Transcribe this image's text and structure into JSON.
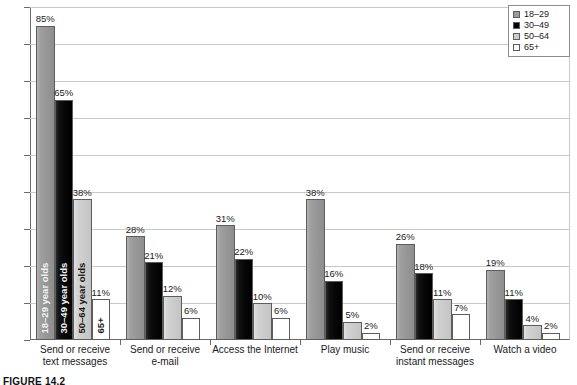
{
  "chart_data": {
    "type": "bar",
    "title": "",
    "xlabel": "",
    "ylabel": "",
    "ylim": [
      0,
      90
    ],
    "ytick_step": 10,
    "ytick_labels": [
      "0%",
      "10%",
      "20%",
      "30%",
      "40%",
      "50%",
      "60%",
      "70%",
      "80%",
      "90%"
    ],
    "grid": true,
    "legend_position": "top-right",
    "value_suffix": "%",
    "categories": [
      "Send or receive text messages",
      "Send or receive e-mail",
      "Access the Internet",
      "Play music",
      "Send or receive instant messages",
      "Watch a video"
    ],
    "category_lines": [
      [
        "Send or receive",
        "text messages"
      ],
      [
        "Send or receive",
        "e-mail"
      ],
      [
        "Access the Internet"
      ],
      [
        "Play music"
      ],
      [
        "Send or receive",
        "instant messages"
      ],
      [
        "Watch a video"
      ]
    ],
    "series": [
      {
        "name": "18–29",
        "color": "#9a9a9a",
        "values": [
          85,
          28,
          31,
          38,
          26,
          19
        ],
        "labels": [
          "85%",
          "28%",
          "31%",
          "38%",
          "26%",
          "19%"
        ]
      },
      {
        "name": "30–49",
        "color": "#000000",
        "values": [
          65,
          21,
          22,
          16,
          18,
          11
        ],
        "labels": [
          "65%",
          "21%",
          "22%",
          "16%",
          "18%",
          "11%"
        ]
      },
      {
        "name": "50–64",
        "color": "#cccccc",
        "values": [
          38,
          12,
          10,
          5,
          11,
          4
        ],
        "labels": [
          "38%",
          "12%",
          "10%",
          "5%",
          "11%",
          "4%"
        ]
      },
      {
        "name": "65+",
        "color": "#ffffff",
        "values": [
          11,
          6,
          6,
          2,
          7,
          2
        ],
        "labels": [
          "11%",
          "6%",
          "6%",
          "2%",
          "7%",
          "2%"
        ]
      }
    ],
    "in_bar_annotations": [
      {
        "text": "18–29 year olds",
        "tone": "light"
      },
      {
        "text": "30–49 year olds",
        "tone": "light"
      },
      {
        "text": "50–64 year olds",
        "tone": "dark"
      },
      {
        "text": "65+",
        "tone": "dark"
      }
    ]
  },
  "legend": {
    "items": [
      {
        "label": "18–29"
      },
      {
        "label": "30–49"
      },
      {
        "label": "50–64"
      },
      {
        "label": "65+"
      }
    ]
  },
  "caption": {
    "text": "FIGURE 14.2"
  }
}
